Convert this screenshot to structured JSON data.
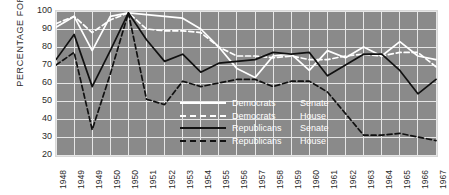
{
  "chart_data": {
    "type": "line",
    "title": "",
    "xlabel": "",
    "ylabel": "PERCENTAGE FOR",
    "ylim": [
      20,
      100
    ],
    "yticks": [
      100,
      90,
      80,
      70,
      60,
      50,
      40,
      30,
      20
    ],
    "grid": true,
    "legend_position": "center",
    "categories": [
      "1948",
      "1949",
      "1949",
      "1950",
      "1950",
      "1951",
      "1952",
      "1953",
      "1954",
      "1955",
      "1956",
      "1957",
      "1958",
      "1959",
      "1960",
      "1961",
      "1962",
      "1963",
      "1964",
      "1965",
      "1966",
      "1967"
    ],
    "series": [
      {
        "name": "Democrats Senate",
        "party": "Democrats",
        "chamber": "Senate",
        "style": "solid",
        "color": "#ffffff",
        "values": [
          91,
          97,
          78,
          97,
          99,
          98,
          97,
          96,
          90,
          80,
          68,
          63,
          75,
          76,
          67,
          78,
          74,
          80,
          75,
          83,
          75,
          73
        ]
      },
      {
        "name": "Democrats House",
        "party": "Democrats",
        "chamber": "House",
        "style": "dashed",
        "color": "#ffffff",
        "values": [
          93,
          97,
          88,
          95,
          99,
          90,
          89,
          89,
          88,
          80,
          75,
          75,
          74,
          75,
          73,
          73,
          75,
          76,
          75,
          77,
          77,
          69
        ]
      },
      {
        "name": "Republicans Senate",
        "party": "Republicans",
        "chamber": "Senate",
        "style": "solid",
        "color": "#111111",
        "values": [
          73,
          87,
          58,
          78,
          99,
          84,
          72,
          76,
          66,
          71,
          72,
          73,
          77,
          76,
          77,
          64,
          70,
          76,
          76,
          67,
          54,
          62
        ]
      },
      {
        "name": "Republicans House",
        "party": "Republicans",
        "chamber": "House",
        "style": "dashed",
        "color": "#111111",
        "values": [
          70,
          77,
          34,
          65,
          99,
          51,
          48,
          61,
          58,
          60,
          62,
          62,
          58,
          61,
          61,
          55,
          43,
          31,
          31,
          32,
          30,
          28
        ]
      }
    ]
  },
  "legend": {
    "rows": [
      {
        "party": "Democrats",
        "chamber": "Senate"
      },
      {
        "party": "Democrats",
        "chamber": "House"
      },
      {
        "party": "Republicans",
        "chamber": "Senate"
      },
      {
        "party": "Republicans",
        "chamber": "House"
      }
    ]
  },
  "axis": {
    "y_title": "PERCENTAGE FOR"
  },
  "colors": {
    "plot_background": "#8a8a8a",
    "gridline": "#e6e6e6",
    "democrats": "#ffffff",
    "republicans": "#111111",
    "text": "#2b2b2b"
  }
}
